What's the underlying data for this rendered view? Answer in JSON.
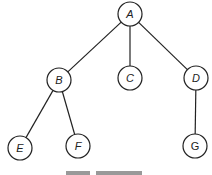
{
  "diagram": {
    "type": "tree",
    "nodes": [
      {
        "id": "A",
        "label": "A",
        "x": 130,
        "y": 14,
        "italic": true
      },
      {
        "id": "B",
        "label": "B",
        "x": 59,
        "y": 80,
        "italic": true
      },
      {
        "id": "C",
        "label": "C",
        "x": 130,
        "y": 78,
        "italic": true
      },
      {
        "id": "D",
        "label": "D",
        "x": 196,
        "y": 78,
        "italic": true
      },
      {
        "id": "E",
        "label": "E",
        "x": 20,
        "y": 148,
        "italic": true
      },
      {
        "id": "F",
        "label": "F",
        "x": 78,
        "y": 146,
        "italic": true
      },
      {
        "id": "G",
        "label": "G",
        "x": 195,
        "y": 146,
        "italic": false
      }
    ],
    "edges": [
      {
        "from": "A",
        "to": "B"
      },
      {
        "from": "A",
        "to": "C"
      },
      {
        "from": "A",
        "to": "D"
      },
      {
        "from": "B",
        "to": "E"
      },
      {
        "from": "B",
        "to": "F"
      },
      {
        "from": "D",
        "to": "G"
      }
    ],
    "node_radius": 12
  }
}
